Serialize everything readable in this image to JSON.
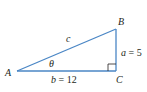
{
  "figure": {
    "type": "right-triangle",
    "line_color": "#4a86c5",
    "text_color": "#231f20",
    "vertices": {
      "A": {
        "label": "A",
        "x": 17,
        "y": 71
      },
      "B": {
        "label": "B",
        "x": 116,
        "y": 29
      },
      "C": {
        "label": "C",
        "x": 116,
        "y": 71
      }
    },
    "sides": {
      "hypotenuse": {
        "label": "c"
      },
      "opposite": {
        "label": "a = 5",
        "var": "a",
        "value": "5"
      },
      "adjacent": {
        "label": "b = 12",
        "var": "b",
        "value": "12"
      }
    },
    "angle": {
      "label": "θ",
      "at": "A"
    },
    "right_angle_marker": {
      "at": "C"
    }
  }
}
